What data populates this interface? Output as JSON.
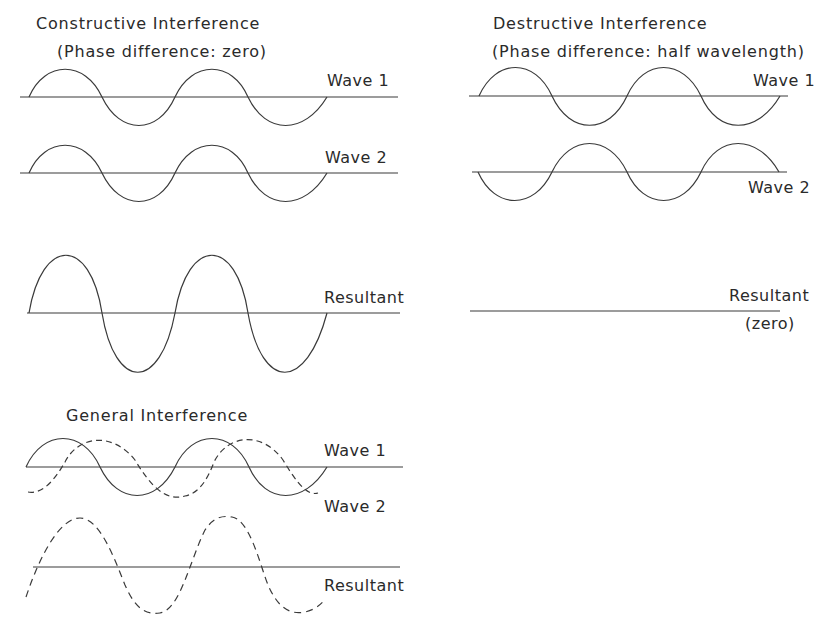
{
  "constructive": {
    "title": "Constructive  Interference",
    "subtitle": "(Phase  difference: zero)",
    "wave1_label": "Wave 1",
    "wave2_label": "Wave 2",
    "resultant_label": "Resultant"
  },
  "destructive": {
    "title": "Destructive   Interference",
    "subtitle": "(Phase  difference: half  wavelength)",
    "wave1_label": "Wave 1",
    "wave2_label": "Wave 2",
    "resultant_label": "Resultant",
    "resultant_note": "(zero)"
  },
  "general": {
    "title": "General  Interference",
    "wave1_label": "Wave 1",
    "wave2_label": "Wave 2",
    "resultant_label": "Resultant"
  },
  "colors": {
    "line": "#333333",
    "background": "#ffffff"
  }
}
